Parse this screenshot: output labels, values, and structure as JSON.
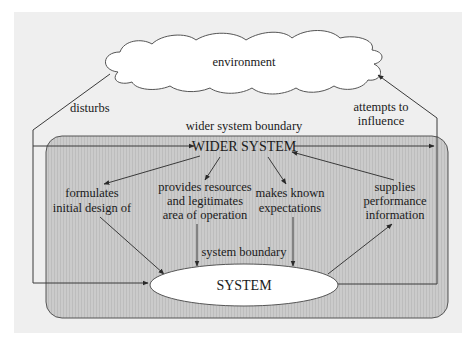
{
  "diagram": {
    "environment": {
      "label": "environment"
    },
    "wider_system": {
      "boundary_label": "wider system boundary",
      "label": "WIDER SYSTEM"
    },
    "system": {
      "boundary_label": "system boundary",
      "label": "SYSTEM"
    },
    "edges": {
      "disturbs": "disturbs",
      "attempts_to_influence": [
        "attempts to",
        "influence"
      ],
      "formulates": [
        "formulates",
        "initial design of"
      ],
      "provides_resources": [
        "provides resources",
        "and legitimates",
        "area of operation"
      ],
      "makes_known": [
        "makes known",
        "expectations"
      ],
      "supplies_performance": [
        "supplies",
        "performance",
        "information"
      ]
    },
    "colors": {
      "panel_bg": "#efefef",
      "wider_fill": "#c6c6c6",
      "node_fill": "#ffffff",
      "line": "#3a3a3a"
    }
  }
}
